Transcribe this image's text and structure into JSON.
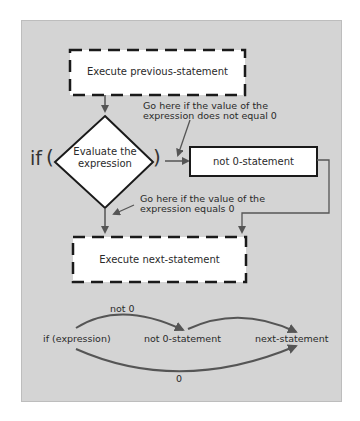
{
  "flowchart": {
    "prev_box": "Execute previous-statement",
    "if_keyword": "if",
    "open_paren": "(",
    "close_paren": ")",
    "decision": {
      "line1": "Evaluate the",
      "line2": "expression"
    },
    "not0_box": "not 0-statement",
    "next_box": "Execute next-statement",
    "annotation_not_zero": {
      "line1": "Go here if the value of the",
      "line2": "expression does not equal 0"
    },
    "annotation_zero": {
      "line1": "Go here if the value of the",
      "line2": "expression equals 0"
    }
  },
  "summary": {
    "node_if": "if (expression)",
    "node_not0": "not 0-statement",
    "node_next": "next-statement",
    "edge_not0": "not 0",
    "edge_zero": "0"
  },
  "colors": {
    "panel": "#d4d4d4",
    "stroke": "#1a1a1a",
    "arrow": "#555555",
    "box_fill": "#ffffff"
  }
}
